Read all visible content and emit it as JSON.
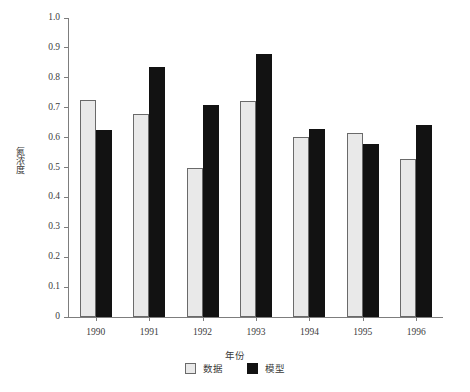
{
  "chart_data": {
    "type": "bar",
    "title": "",
    "xlabel": "年份",
    "ylabel": "氮浓度",
    "categories": [
      "1990",
      "1991",
      "1992",
      "1993",
      "1994",
      "1995",
      "1996"
    ],
    "series": [
      {
        "name": "数据",
        "color": "#e9e9e9",
        "values": [
          0.727,
          0.678,
          0.5,
          0.722,
          0.601,
          0.616,
          0.528
        ]
      },
      {
        "name": "模型",
        "color": "#121212",
        "values": [
          0.625,
          0.836,
          0.708,
          0.88,
          0.628,
          0.578,
          0.641
        ]
      }
    ],
    "ylim": [
      0,
      1.0
    ],
    "y_ticks": [
      "0",
      "0.1",
      "0.2",
      "0.3",
      "0.4",
      "0.5",
      "0.6",
      "0.7",
      "0.8",
      "0.9",
      "1.0"
    ],
    "y_tick_values": [
      0,
      0.1,
      0.2,
      0.3,
      0.4,
      0.5,
      0.6,
      0.7,
      0.8,
      0.9,
      1.0
    ],
    "grid": false,
    "legend_position": "bottom",
    "axis_color": "#7d7d7d",
    "background": "#ffffff"
  }
}
